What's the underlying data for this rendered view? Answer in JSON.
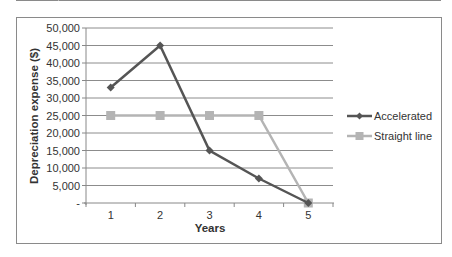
{
  "chart_data": {
    "type": "line",
    "title": "",
    "xlabel": "Years",
    "ylabel": "Depreciation expense ($)",
    "categories": [
      "1",
      "2",
      "3",
      "4",
      "5"
    ],
    "series": [
      {
        "name": "Accelerated",
        "values": [
          33000,
          45000,
          15000,
          7000,
          0
        ],
        "color": "#555555",
        "marker": "diamond"
      },
      {
        "name": "Straight line",
        "values": [
          25000,
          25000,
          25000,
          25000,
          0
        ],
        "color": "#b4b4b4",
        "marker": "square"
      }
    ],
    "ylim": [
      0,
      50000
    ],
    "yticks": [
      0,
      5000,
      10000,
      15000,
      20000,
      25000,
      30000,
      35000,
      40000,
      45000,
      50000
    ],
    "ytick_labels": [
      "-",
      "5,000",
      "10,000",
      "15,000",
      "20,000",
      "25,000",
      "30,000",
      "35,000",
      "40,000",
      "45,000",
      "50,000"
    ],
    "grid": true,
    "legend_position": "right"
  },
  "legend": {
    "accelerated": "Accelerated",
    "straight_line": "Straight line"
  }
}
